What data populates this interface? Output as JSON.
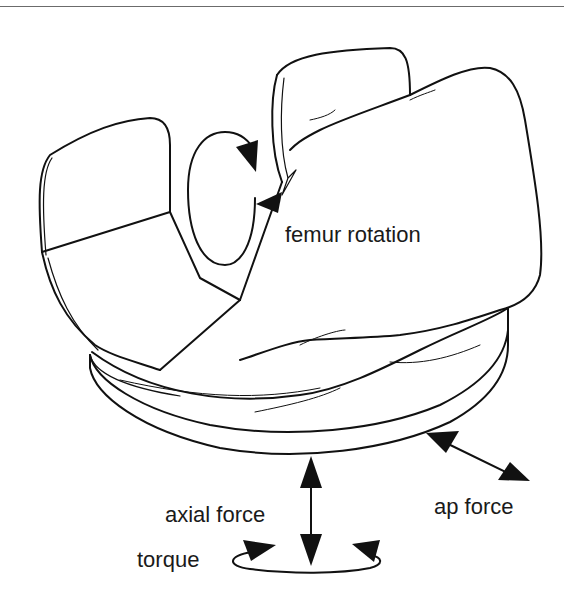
{
  "figure": {
    "labels": {
      "femur_rotation": "femur rotation",
      "axial_force": "axial force",
      "torque": "torque",
      "ap_force": "ap force"
    },
    "colors": {
      "line": "#111111",
      "background": "#ffffff",
      "rule": "#6b6b6b"
    }
  }
}
